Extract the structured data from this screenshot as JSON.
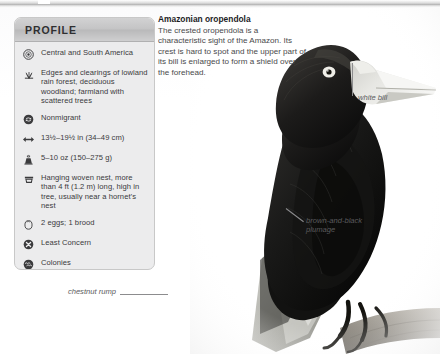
{
  "profile": {
    "header_title": "PROFILE",
    "rows": [
      {
        "icon": "globe-range-icon",
        "text": "Central and\nSouth America"
      },
      {
        "icon": "habitat-grass-icon",
        "text": "Edges and clearings of lowland rain forest, deciduous woodland; farmland with scattered trees"
      },
      {
        "icon": "migration-icon",
        "text": "Nonmigrant"
      },
      {
        "icon": "size-arrows-icon",
        "text": "13½–19½ in (34–49 cm)"
      },
      {
        "icon": "weight-icon",
        "text": "5–10 oz (150–275 g)"
      },
      {
        "icon": "nest-icon",
        "text": "Hanging woven nest, more than 4 ft (1.2 m) long, high in tree, usually near a hornet’s nest"
      },
      {
        "icon": "egg-icon",
        "text": "2 eggs; 1 brood"
      },
      {
        "icon": "conservation-status-icon",
        "text": "Least Concern"
      },
      {
        "icon": "social-flock-icon",
        "text": "Colonies"
      }
    ]
  },
  "description": {
    "heading": "Amazonian oropendola",
    "body": "The crested oropendola is a characteristic sight of the Amazon. Its crest is hard to spot and the upper part of its bill is enlarged to form a shield over the forehead."
  },
  "callouts": {
    "white_bill": "white bill",
    "plumage": "brown-and-black plumage",
    "rump": "chestnut rump"
  },
  "colors": {
    "panel_bg": "#ececed",
    "panel_header": "#c4c4c5",
    "panel_border": "#c8c8c8",
    "body_text": "#3a3a3c",
    "callout_text": "#5b5b5d",
    "bird_dark": "#171717",
    "bill_pale": "#e3e3e0"
  }
}
